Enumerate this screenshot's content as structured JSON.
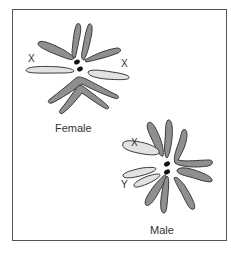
{
  "figure": {
    "groups": [
      {
        "caption": "Female",
        "sex_chromosome_labels": [
          "X",
          "X"
        ]
      },
      {
        "caption": "Male",
        "sex_chromosome_labels": [
          "X",
          "Y"
        ]
      }
    ],
    "colors": {
      "autosome_fill": "#8f8f8f",
      "sex_chromosome_fill": "#e2e2e2",
      "outline": "#3a3a3a",
      "centromere": "#111111",
      "frame": "#555555"
    }
  }
}
